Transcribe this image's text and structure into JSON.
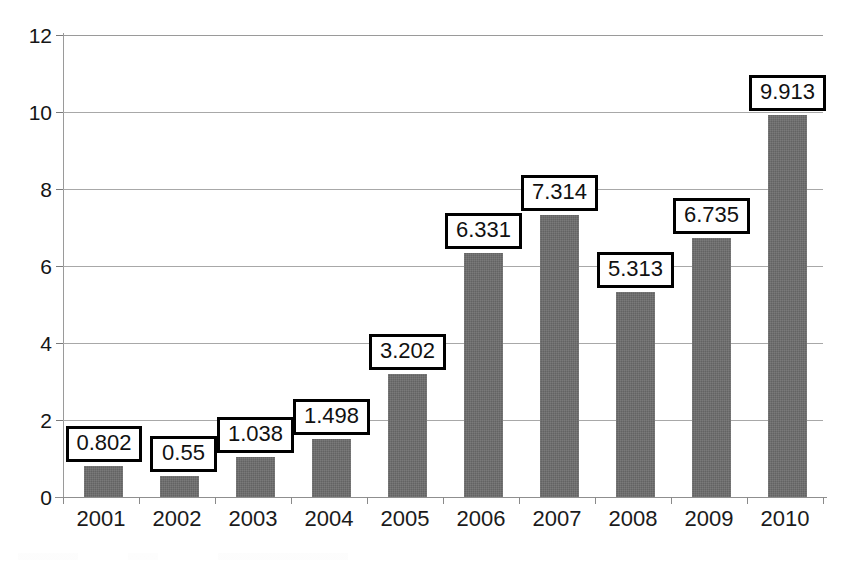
{
  "chart_data": {
    "type": "bar",
    "title": "",
    "subtitle": "",
    "xlabel": "",
    "ylabel": "",
    "categories": [
      "2001",
      "2002",
      "2003",
      "2004",
      "2005",
      "2006",
      "2007",
      "2008",
      "2009",
      "2010"
    ],
    "values": [
      0.802,
      0.55,
      1.038,
      1.498,
      3.202,
      6.331,
      7.314,
      5.313,
      6.735,
      9.913
    ],
    "data_labels": [
      "0.802",
      "0.55",
      "1.038",
      "1.498",
      "3.202",
      "6.331",
      "7.314",
      "5.313",
      "6.735",
      "9.913"
    ],
    "series": [
      {
        "name": "",
        "values": [
          0.802,
          0.55,
          1.038,
          1.498,
          3.202,
          6.331,
          7.314,
          5.313,
          6.735,
          9.913
        ]
      }
    ],
    "ylim": [
      0,
      12
    ],
    "ytick_labels": [
      "0",
      "2",
      "4",
      "6",
      "8",
      "10",
      "12"
    ],
    "ytick_values": [
      0,
      2,
      4,
      6,
      8,
      10,
      12
    ],
    "grid": "horizontal",
    "legend": "none",
    "bar_color": "#6d6d6d",
    "label_box_border_color": "#000000",
    "label_box_fill_color": "#ffffff",
    "gridline_color": "#a8a8a8",
    "axis_color": "#8f8f8f",
    "text_color": "#1a1a1a"
  }
}
